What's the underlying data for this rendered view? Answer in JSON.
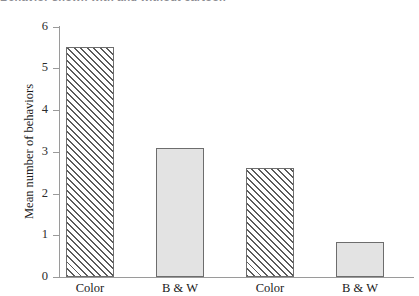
{
  "caption": {
    "text": "Behavior shown with and without cartoon"
  },
  "chart_data": {
    "type": "bar",
    "title": "",
    "xlabel": "",
    "ylabel": "Mean number of behaviors",
    "categories": [
      "Color",
      "B & W",
      "Color",
      "B & W"
    ],
    "values": [
      5.5,
      3.1,
      2.6,
      0.85
    ],
    "series": [
      {
        "name": "Mean number of behaviors",
        "values": [
          5.5,
          3.1,
          2.6,
          0.85
        ]
      }
    ],
    "bar_styles": [
      "hatched",
      "solid",
      "hatched",
      "solid"
    ],
    "ylim": [
      0,
      6
    ],
    "yticks": [
      0,
      1,
      2,
      3,
      4,
      5,
      6
    ],
    "ytick_labels": [
      "0",
      "1",
      "2",
      "3",
      "4",
      "5",
      "6"
    ],
    "grid": false,
    "legend": "none"
  },
  "colors": {
    "axis": "#9a9a9a",
    "bar_border": "#6d6d6d",
    "bar_solid_fill": "#e3e3e3",
    "bar_hatch_line": "#5b5b5b",
    "bar_hatch_background": "#f2f2f2",
    "text": "#1a1a1a",
    "background": "#ffffff"
  }
}
